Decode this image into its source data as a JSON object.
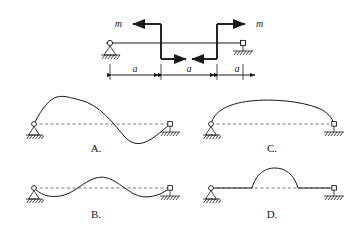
{
  "figure": {
    "title": "",
    "top_diagram": {
      "name": "beam-with-moment-couple",
      "beam_label": "",
      "moment_labels": [
        {
          "id": "m-left",
          "text": "m",
          "arrow_direction": "left"
        },
        {
          "id": "m-right",
          "text": "m",
          "arrow_direction": "right"
        }
      ],
      "internal_arrows": [
        {
          "id": "arrow-lower-left",
          "direction": "right"
        },
        {
          "id": "arrow-lower-right",
          "direction": "left"
        }
      ],
      "dimensions": [
        {
          "id": "dim-1",
          "label": "a"
        },
        {
          "id": "dim-2",
          "label": "a"
        },
        {
          "id": "dim-3",
          "label": "a"
        }
      ],
      "supports": [
        {
          "id": "support-left",
          "type": "pin"
        },
        {
          "id": "support-right",
          "type": "roller"
        }
      ]
    },
    "options": [
      {
        "id": "option-a",
        "label": "A.",
        "shape": "s-curve-up-then-down",
        "left_support": "pin",
        "right_support": "roller"
      },
      {
        "id": "option-c",
        "label": "C.",
        "shape": "single-arch-upward",
        "left_support": "pin",
        "right_support": "roller"
      },
      {
        "id": "option-b",
        "label": "B.",
        "shape": "wave-dip-rise-dip",
        "left_support": "pin",
        "right_support": "roller"
      },
      {
        "id": "option-d",
        "label": "D.",
        "shape": "flat-ends-with-central-bump",
        "left_support": "pin",
        "right_support": "roller"
      }
    ],
    "colors": {
      "ink": "#1a1a1a",
      "dashed": "#555555",
      "background": "#ffffff"
    }
  }
}
